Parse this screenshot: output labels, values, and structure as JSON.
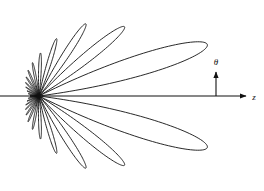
{
  "figure": {
    "title": "",
    "caption": "",
    "background_color": "#ffffff",
    "line_color": "#111111",
    "line_width": 0.9,
    "width": 264,
    "height": 191
  },
  "axes": {
    "origin": {
      "x": 39,
      "y": 96
    },
    "z_axis": {
      "label": "z",
      "name": "z-axis",
      "from": {
        "x": 0,
        "y": 96
      },
      "to": {
        "x": 246,
        "y": 96
      },
      "label_pos": {
        "x": 254,
        "y": 99
      },
      "arrow": true
    },
    "theta_axis": {
      "label": "θ",
      "name": "theta-axis",
      "from": {
        "x": 216,
        "y": 96
      },
      "to": {
        "x": 216,
        "y": 70
      },
      "label_pos": {
        "x": 216,
        "y": 63
      },
      "arrow": true
    }
  },
  "chart_data": {
    "type": "line",
    "subtype": "polar-radiation-pattern",
    "title": "",
    "xlabel": "z",
    "ylabel": "θ",
    "grid": false,
    "legend": null,
    "annotations": [
      {
        "text": "z",
        "x": 254,
        "y": 99
      },
      {
        "text": "θ",
        "x": 216,
        "y": 63
      }
    ],
    "pattern": {
      "angle_unit": "degrees",
      "angle_reference": "measured from +z axis (theta)",
      "radius_unit": "pixels",
      "symmetry": "mirror about z-axis",
      "lobes": [
        {
          "name": "main-lobe",
          "theta_center": 17,
          "half_width": 9.5,
          "radius": 176
        },
        {
          "name": "side-lobe-1",
          "theta_center": 39,
          "half_width": 7.5,
          "radius": 110
        },
        {
          "name": "side-lobe-2",
          "theta_center": 57,
          "half_width": 6.5,
          "radius": 86
        },
        {
          "name": "side-lobe-3",
          "theta_center": 73,
          "half_width": 5.5,
          "radius": 60
        },
        {
          "name": "side-lobe-4",
          "theta_center": 88,
          "half_width": 5.0,
          "radius": 43
        },
        {
          "name": "side-lobe-5",
          "theta_center": 101,
          "half_width": 4.5,
          "radius": 34
        },
        {
          "name": "side-lobe-6",
          "theta_center": 113,
          "half_width": 4.2,
          "radius": 28
        },
        {
          "name": "side-lobe-7",
          "theta_center": 124,
          "half_width": 4.0,
          "radius": 23
        },
        {
          "name": "side-lobe-8",
          "theta_center": 135,
          "half_width": 3.8,
          "radius": 19
        },
        {
          "name": "side-lobe-9",
          "theta_center": 146,
          "half_width": 3.6,
          "radius": 16
        },
        {
          "name": "side-lobe-10",
          "theta_center": 157,
          "half_width": 3.4,
          "radius": 13
        },
        {
          "name": "side-lobe-11",
          "theta_center": 168,
          "half_width": 3.2,
          "radius": 11
        },
        {
          "name": "back-lobe",
          "theta_center": 179,
          "half_width": 3.0,
          "radius": 9
        }
      ]
    }
  }
}
